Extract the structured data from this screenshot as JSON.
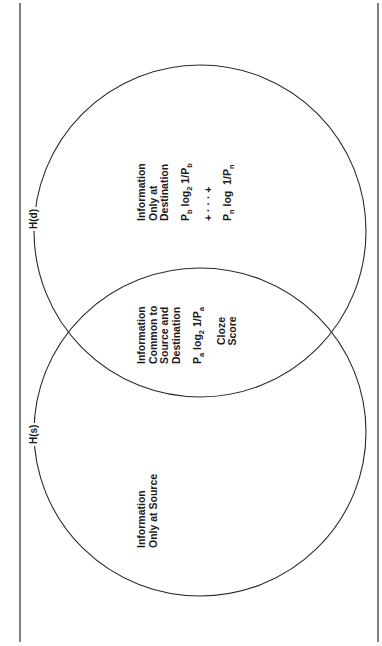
{
  "diagram": {
    "type": "venn",
    "orientation": "rotated -90deg",
    "sets": [
      {
        "id": "destination",
        "label": "H(d)"
      },
      {
        "id": "source",
        "label": "H(s)"
      }
    ],
    "regions": {
      "destination_only": {
        "title_lines": [
          "Information",
          "Only at",
          "Destination"
        ],
        "formula_1": {
          "p": "P",
          "p_sub": "b",
          "log": "log",
          "log_sub": "2",
          "inv": "1/P",
          "inv_sub": "b"
        },
        "ellipsis": "+ · · · +",
        "formula_2": {
          "p": "P",
          "p_sub": "n",
          "log": "log",
          "inv": "1/P",
          "inv_sub": "n"
        }
      },
      "common": {
        "title_lines": [
          "Information",
          "Common to",
          "Source and",
          "Destination"
        ],
        "formula": {
          "p": "P",
          "p_sub": "a",
          "log": "log",
          "log_sub": "2",
          "inv": "1/P",
          "inv_sub": "a"
        },
        "measure_lines": [
          "Cloze",
          "Score"
        ]
      },
      "source_only": {
        "title_lines": [
          "Information",
          "Only at Source"
        ]
      }
    },
    "colors": {
      "line": "#2a2a2a",
      "background": "#ffffff",
      "text": "#1a1a1a"
    }
  }
}
